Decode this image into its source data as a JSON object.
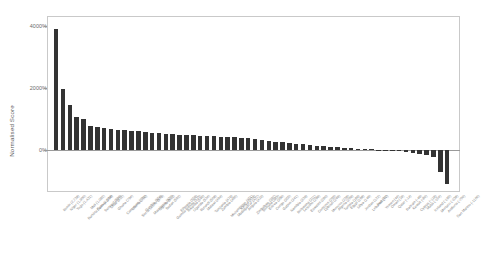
{
  "chart_data": {
    "type": "bar",
    "title": "",
    "xlabel": "",
    "ylabel": "Normalised Score",
    "ylim": [
      -1250,
      4200
    ],
    "yticks": [
      0,
      2000,
      4000
    ],
    "ytick_labels": [
      "0%",
      "2000%",
      "4000%"
    ],
    "grid": false,
    "legend": null,
    "bar_color": "#333333",
    "categories": [
      "Benin (2,728)",
      "Niger (1,900)",
      "Togo (1,431)",
      "Burkina Faso (1,169)",
      "Mali (1,082)",
      "Guinea (914)",
      "Senegal (866)",
      "Chad (812)",
      "Ghana (764)",
      "Cameroon (731)",
      "Liberia (702)",
      "Sierra Leone (676)",
      "Gambia (654)",
      "Mauritania (632)",
      "Nigeria (612)",
      "Sudan (592)",
      "Guinea-Bissau (573)",
      "Ethiopia (556)",
      "Rwanda (540)",
      "Uganda (524)",
      "Burundi (508)",
      "Malawi (494)",
      "Tanzania (479)",
      "Zambia (465)",
      "Mozambique (451)",
      "Madagascar (437)",
      "Kenya (424)",
      "Angola (410)",
      "Zimbabwe (397)",
      "Somalia (383)",
      "Eritrea (369)",
      "Congo (355)",
      "Gabon (341)",
      "Namibia (326)",
      "Botswana (311)",
      "Lesotho (296)",
      "Eswatini (280)",
      "Comoros (263)",
      "Djibouti (246)",
      "Morocco (228)",
      "Algeria (209)",
      "Tunisia (189)",
      "Egypt (168)",
      "Libya (146)",
      "Jordan (122)",
      "Lebanon (97)",
      "Iraq (71)",
      "Yemen (44)",
      "Oman (16)",
      "Qatar (-14)",
      "Bahrain (-46)",
      "Kuwait (-80)",
      "Cyprus (-116)",
      "Malta (-154)",
      "Iceland (-195)",
      "Monaco (-238)",
      "Andorra (-700)",
      "San Marino (-1100)"
    ],
    "values": [
      3900,
      1980,
      1460,
      1060,
      1010,
      760,
      740,
      700,
      690,
      660,
      640,
      620,
      600,
      580,
      560,
      545,
      530,
      515,
      500,
      488,
      476,
      464,
      452,
      440,
      428,
      416,
      404,
      392,
      380,
      368,
      330,
      300,
      270,
      245,
      220,
      200,
      180,
      160,
      140,
      120,
      100,
      82,
      66,
      52,
      40,
      28,
      18,
      10,
      4,
      -10,
      -30,
      -55,
      -85,
      -120,
      -165,
      -215,
      -700,
      -1100
    ]
  }
}
